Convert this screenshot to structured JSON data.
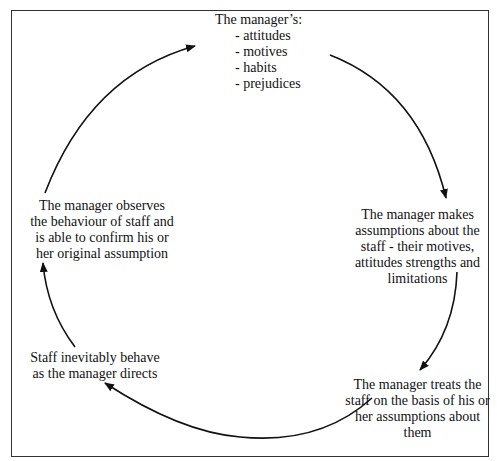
{
  "diagram": {
    "type": "cycle",
    "direction": "clockwise",
    "nodes": [
      {
        "id": "manager-traits",
        "title": "The manager’s:",
        "items": [
          "attitudes",
          "motives",
          "habits",
          "prejudices"
        ]
      },
      {
        "id": "makes-assumptions",
        "lines": [
          "The manager makes",
          "assumptions about the",
          "staff - their motives,",
          "attitudes strengths and",
          "limitations"
        ]
      },
      {
        "id": "treats-staff",
        "lines": [
          "The manager treats the",
          "staff on the basis of his or",
          "her assumptions about",
          "them"
        ]
      },
      {
        "id": "staff-behave",
        "lines": [
          "Staff inevitably behave",
          "as the manager directs"
        ]
      },
      {
        "id": "observes-confirms",
        "lines": [
          "The manager observes",
          "the behaviour of staff and",
          "is able to confirm his or",
          "her original assumption"
        ]
      }
    ],
    "edges": [
      {
        "from": "manager-traits",
        "to": "makes-assumptions"
      },
      {
        "from": "makes-assumptions",
        "to": "treats-staff"
      },
      {
        "from": "treats-staff",
        "to": "staff-behave"
      },
      {
        "from": "staff-behave",
        "to": "observes-confirms"
      },
      {
        "from": "observes-confirms",
        "to": "manager-traits"
      }
    ],
    "colors": {
      "line": "#111111",
      "border": "#333333",
      "background": "#ffffff"
    }
  }
}
